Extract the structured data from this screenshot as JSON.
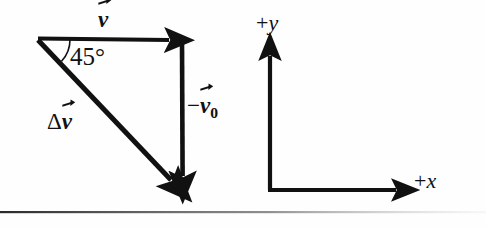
{
  "figure": {
    "background_color": "#fefefe",
    "stroke_color": "#111111"
  },
  "vectors": [
    {
      "id": "v",
      "label_prefix": "",
      "label_symbol": "v",
      "label_subscript": "",
      "icon": "over-arrow-icon",
      "description": "horizontal vector v pointing right along the top",
      "from": [
        38,
        38
      ],
      "to": [
        180,
        40
      ]
    },
    {
      "id": "minus-v0",
      "label_prefix": "−",
      "label_symbol": "v",
      "label_subscript": "0",
      "icon": "over-arrow-icon",
      "description": "vertical vector minus v-naught pointing down on the right",
      "from": [
        182,
        40
      ],
      "to": [
        183,
        193
      ]
    },
    {
      "id": "delta-v",
      "label_prefix": "Δ",
      "label_symbol": "v",
      "label_subscript": "",
      "icon": "over-arrow-icon",
      "description": "diagonal resultant vector delta v from apex down to lower right",
      "from": [
        38,
        40
      ],
      "to": [
        183,
        193
      ]
    }
  ],
  "angle": {
    "value": "45°",
    "vertex": [
      38,
      39
    ],
    "radius": 32
  },
  "axes": {
    "origin": [
      270,
      190
    ],
    "y_axis": {
      "label": "+y",
      "plus": "+",
      "symbol": "y",
      "tip": [
        270,
        46
      ]
    },
    "x_axis": {
      "label": "+x",
      "plus": "+",
      "symbol": "x",
      "tip": [
        408,
        190
      ]
    }
  },
  "rule": {
    "name": "bottom-divider",
    "y": 212
  }
}
